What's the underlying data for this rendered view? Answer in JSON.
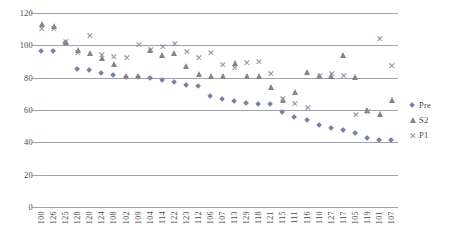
{
  "chart_data": {
    "type": "scatter",
    "title": "",
    "xlabel": "",
    "ylabel": "",
    "ylim": [
      0,
      120
    ],
    "ytick_labels": [
      "0",
      "20",
      "40",
      "60",
      "80",
      "100",
      "120"
    ],
    "ytick_values": [
      0,
      20,
      40,
      60,
      80,
      100,
      120
    ],
    "grid": true,
    "legend_position": "right",
    "categories": [
      "100",
      "126",
      "125",
      "128",
      "120",
      "124",
      "108",
      "102",
      "109",
      "104",
      "114",
      "122",
      "123",
      "112",
      "106",
      "107",
      "113",
      "129",
      "118",
      "121",
      "115",
      "111",
      "116",
      "110",
      "127",
      "117",
      "105",
      "119",
      "101",
      "107"
    ],
    "series": [
      {
        "name": "Pre",
        "marker": "diamond",
        "color": "#7b7fa8",
        "values": [
          96,
          96,
          101,
          85,
          84,
          82,
          81,
          80,
          80,
          79,
          78,
          77,
          75,
          74,
          68,
          66,
          65,
          64,
          63,
          63,
          58,
          55,
          53,
          50,
          48,
          47,
          45,
          42,
          41,
          41
        ]
      },
      {
        "name": "S2",
        "marker": "triangle",
        "color": "#8d7f86",
        "values": [
          113,
          112,
          102,
          97,
          95,
          92,
          88,
          81,
          81,
          97,
          94,
          95,
          87,
          82,
          81,
          81,
          89,
          81,
          81,
          74,
          66,
          71,
          83,
          81,
          81,
          94,
          80,
          60,
          57,
          66
        ]
      },
      {
        "name": "P1",
        "marker": "cross",
        "color": "#8b8b9e",
        "values": [
          110,
          110,
          102,
          95,
          106,
          94,
          93,
          92,
          100,
          97,
          99,
          101,
          96,
          92,
          95,
          88,
          86,
          89,
          90,
          82,
          67,
          64,
          61,
          81,
          82,
          81,
          57,
          59,
          104,
          87
        ]
      }
    ]
  },
  "legend": {
    "items": [
      {
        "label": "Pre",
        "marker": "diamond-marker"
      },
      {
        "label": "S2",
        "marker": "triangle-marker"
      },
      {
        "label": "P1",
        "marker": "cross-marker"
      }
    ]
  }
}
